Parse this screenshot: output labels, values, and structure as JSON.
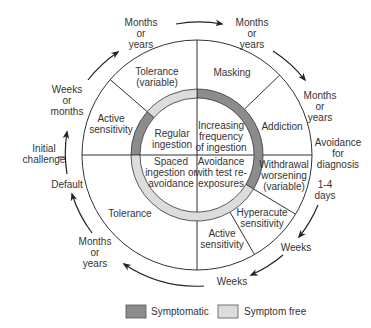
{
  "colors": {
    "symptomatic": "#8c8c8c",
    "symptom_free": "#dcdcdc",
    "line": "#333333",
    "text": "#333333"
  },
  "outer_segments": {
    "tolerance_variable": [
      "Tolerance",
      "(variable)"
    ],
    "masking": [
      "Masking"
    ],
    "addiction": [
      "Addiction"
    ],
    "withdrawal_worsening": [
      "Withdrawal",
      "worsening",
      "(variable)"
    ],
    "hyperacute_sensitivity": [
      "Hyperacute",
      "sensitivity"
    ],
    "active_sensitivity_lower": [
      "Active",
      "sensitivity"
    ],
    "tolerance": [
      "Tolerance"
    ],
    "active_sensitivity_upper": [
      "Active",
      "sensitivity"
    ]
  },
  "inner_quadrants": {
    "regular_ingestion": [
      "Regular",
      "ingestion"
    ],
    "increasing_frequency": [
      "Increasing",
      "frequency",
      "of ingestion"
    ],
    "spaced_ingestion": [
      "Spaced",
      "ingestion or",
      "avoidance"
    ],
    "avoidance_test": [
      "Avoidance",
      "with test re-",
      "exposures"
    ]
  },
  "time_labels": {
    "top_left_months": [
      "Months",
      "or",
      "years"
    ],
    "top_right_months": [
      "Months",
      "or",
      "years"
    ],
    "right_months": [
      "Months",
      "or",
      "years"
    ],
    "avoidance_for_diagnosis": [
      "Avoidance",
      "for",
      "diagnosis"
    ],
    "one_four_days": [
      "1-4",
      "days"
    ],
    "weeks_right": [
      "Weeks"
    ],
    "weeks_bottom": [
      "Weeks"
    ],
    "bottom_left_months": [
      "Months",
      "or",
      "years"
    ],
    "default": [
      "Default"
    ],
    "initial_challenge": [
      "Initial",
      "challenge"
    ],
    "weeks_or_months": [
      "Weeks",
      "or",
      "months"
    ]
  },
  "legend": {
    "symptomatic_label": "Symptomatic",
    "symptom_free_label": "Symptom free"
  }
}
